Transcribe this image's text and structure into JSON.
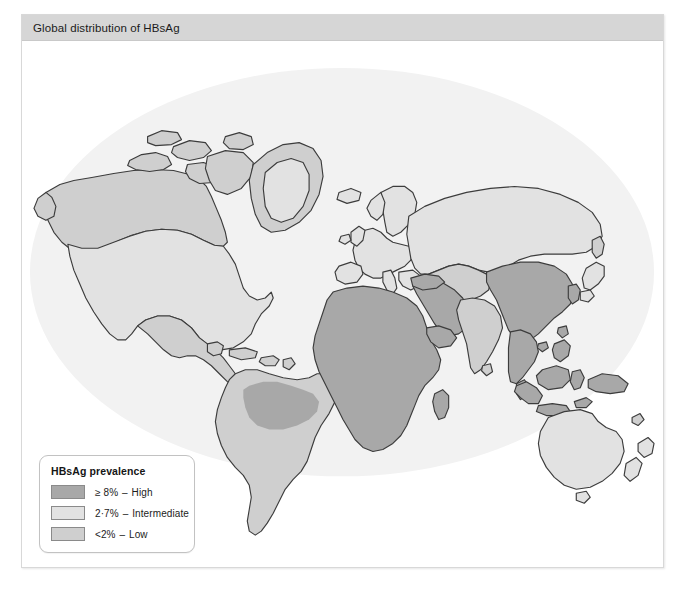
{
  "figure": {
    "header_title": "Global distribution of HBsAg"
  },
  "legend": {
    "title": "HBsAg prevalence",
    "items": [
      {
        "swatch": "high-swatch",
        "range": "≥ 8%",
        "dash": "–",
        "label": "High",
        "color": "#a8a8a8"
      },
      {
        "swatch": "intermediate-swatch",
        "range": "2·7%",
        "dash": "–",
        "label": "Intermediate",
        "color": "#e2e2e2"
      },
      {
        "swatch": "low-swatch",
        "range": "<2%",
        "dash": "–",
        "label": "Low",
        "color": "#cfcfcf"
      }
    ]
  },
  "map": {
    "ocean_color": "#f2f2f2",
    "outline_color": "#3c3c3c",
    "background_color": "#ffffff",
    "categories": {
      "high": "#a8a8a8",
      "intermediate": "#cfcfcf",
      "low": "#e2e2e2"
    },
    "regions": [
      {
        "name": "alaska-northern-canada",
        "category": "intermediate"
      },
      {
        "name": "greenland",
        "category": "intermediate"
      },
      {
        "name": "united-states",
        "category": "low"
      },
      {
        "name": "southern-canada",
        "category": "low"
      },
      {
        "name": "mexico-central-america",
        "category": "intermediate"
      },
      {
        "name": "caribbean",
        "category": "intermediate"
      },
      {
        "name": "south-america",
        "category": "intermediate"
      },
      {
        "name": "amazon-basin",
        "category": "high"
      },
      {
        "name": "western-europe",
        "category": "low"
      },
      {
        "name": "scandinavia",
        "category": "low"
      },
      {
        "name": "eastern-europe-russia",
        "category": "low"
      },
      {
        "name": "middle-east",
        "category": "high"
      },
      {
        "name": "north-africa",
        "category": "high"
      },
      {
        "name": "sub-saharan-africa",
        "category": "high"
      },
      {
        "name": "madagascar",
        "category": "high"
      },
      {
        "name": "central-asia",
        "category": "intermediate"
      },
      {
        "name": "india-south-asia",
        "category": "intermediate"
      },
      {
        "name": "china",
        "category": "high"
      },
      {
        "name": "southeast-asia",
        "category": "high"
      },
      {
        "name": "indonesia-philippines",
        "category": "high"
      },
      {
        "name": "japan",
        "category": "low"
      },
      {
        "name": "korea",
        "category": "high"
      },
      {
        "name": "australia",
        "category": "low"
      },
      {
        "name": "new-zealand",
        "category": "low"
      },
      {
        "name": "papua-new-guinea",
        "category": "high"
      }
    ]
  }
}
